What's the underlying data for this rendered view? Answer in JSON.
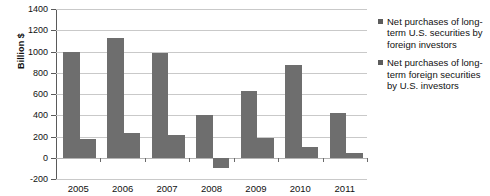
{
  "chart_data": {
    "type": "bar",
    "title": "",
    "xlabel": "",
    "ylabel": "Billion $",
    "categories": [
      "2005",
      "2006",
      "2007",
      "2008",
      "2009",
      "2010",
      "2011"
    ],
    "series": [
      {
        "name": "Net purchases of long-term U.S. securities by foreign investors",
        "values": [
          1000,
          1130,
          990,
          400,
          630,
          870,
          420
        ]
      },
      {
        "name": "Net purchases of long-term foreign securities by U.S. investors",
        "values": [
          180,
          230,
          215,
          -100,
          185,
          105,
          45
        ]
      }
    ],
    "ylim": [
      -200,
      1400
    ],
    "ytick_labels": [
      "1400",
      "1200",
      "1000",
      "800",
      "600",
      "400",
      "200",
      "0",
      "-200"
    ],
    "ytick_values": [
      1400,
      1200,
      1000,
      800,
      600,
      400,
      200,
      0,
      -200
    ],
    "grid": true,
    "legend_position": "right",
    "bar_color": "#6e6e6e",
    "grid_color": "#c9c9c9",
    "axis_color": "#5a5a5a"
  },
  "legend": {
    "entries": [
      "Net purchases of long-term U.S. securities by foreign investors",
      "Net purchases of long-term foreign securities by U.S. investors"
    ]
  }
}
